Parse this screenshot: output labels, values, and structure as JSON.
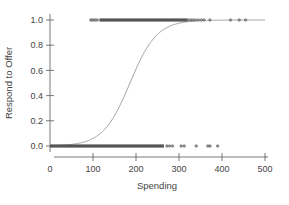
{
  "chart_data": {
    "type": "scatter",
    "title": "",
    "xlabel": "Spending",
    "ylabel": "Respond to Offer",
    "xlim": [
      0,
      500
    ],
    "ylim": [
      0.0,
      1.0
    ],
    "x_ticks": [
      0,
      100,
      200,
      300,
      400,
      500
    ],
    "y_ticks": [
      0.0,
      0.2,
      0.4,
      0.6,
      0.8,
      1.0
    ],
    "x_tick_labels": [
      "0",
      "100",
      "200",
      "300",
      "400",
      "500"
    ],
    "y_tick_labels": [
      "0.0",
      "0.2",
      "0.4",
      "0.6",
      "0.8",
      "1.0"
    ],
    "grid": false,
    "legend": null,
    "series": [
      {
        "name": "Responded (y=1)",
        "kind": "points",
        "y": 1.0,
        "dense_range": [
          115,
          320
        ],
        "x": [
          95,
          98,
          102,
          106,
          110,
          322,
          328,
          333,
          338,
          345,
          352,
          358,
          372,
          420,
          440,
          455
        ]
      },
      {
        "name": "Did not respond (y=0)",
        "kind": "points",
        "y": 0.0,
        "dense_range": [
          0,
          265
        ],
        "x": [
          272,
          278,
          285,
          305,
          312,
          340,
          367,
          372,
          390
        ]
      },
      {
        "name": "Logistic fit",
        "kind": "curve",
        "model": "logistic",
        "midpoint": 186,
        "slope": 0.032,
        "x": [
          0,
          50,
          100,
          125,
          150,
          175,
          186,
          200,
          225,
          250,
          275,
          300,
          350,
          400,
          500
        ],
        "values": [
          0.003,
          0.013,
          0.06,
          0.12,
          0.24,
          0.41,
          0.5,
          0.61,
          0.78,
          0.89,
          0.95,
          0.97,
          0.99,
          1.0,
          1.0
        ]
      }
    ]
  },
  "colors": {
    "axis": "#555555",
    "points": "#555555",
    "curve": "#8a8a8a",
    "text": "#444444"
  }
}
